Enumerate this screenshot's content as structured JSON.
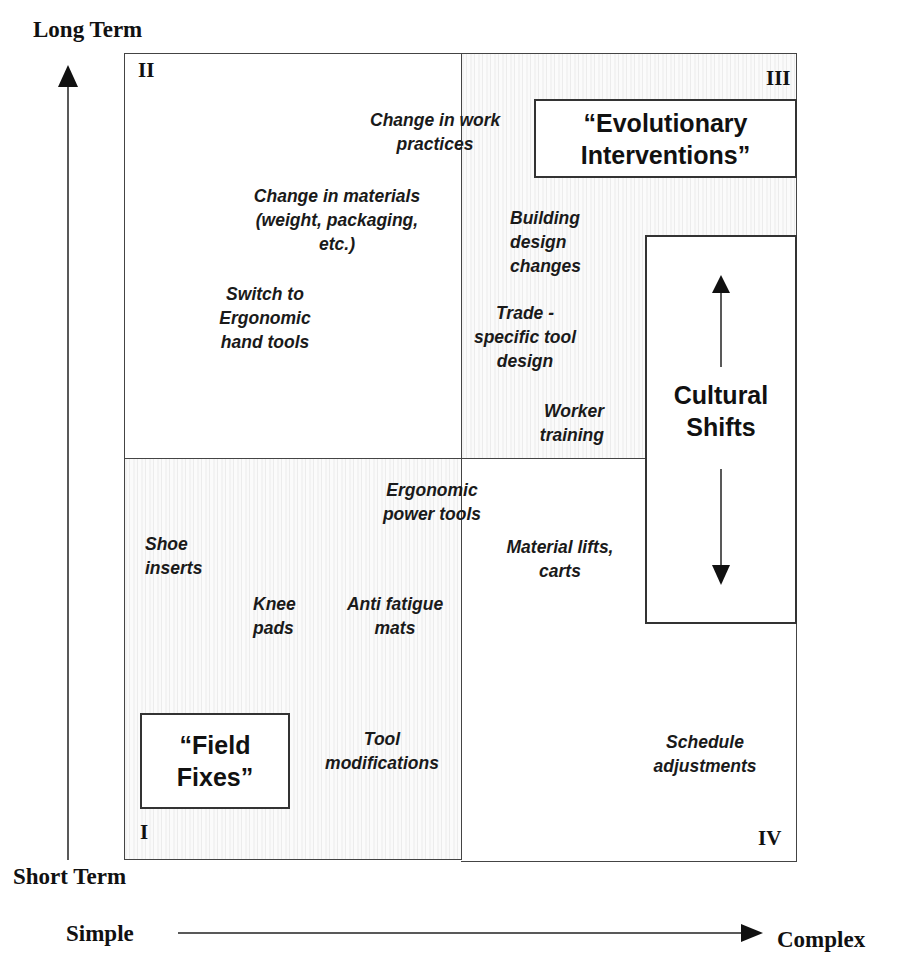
{
  "axes": {
    "y_top_label": "Long Term",
    "y_bottom_label": "Short Term",
    "x_left_label": "Simple",
    "x_right_label": "Complex"
  },
  "quadrants": {
    "q1": {
      "numeral": "I",
      "textured": true
    },
    "q2": {
      "numeral": "II",
      "textured": false
    },
    "q3": {
      "numeral": "III",
      "textured": true
    },
    "q4": {
      "numeral": "IV",
      "textured": false
    }
  },
  "boxes": {
    "field_fixes": "“Field\nFixes”",
    "evolutionary": "“Evolutionary\nInterventions”",
    "cultural_shifts": "Cultural\nShifts"
  },
  "items": {
    "change_work_practices": "Change in work\npractices",
    "change_materials": "Change in materials\n(weight, packaging,\netc.)",
    "switch_ergonomic": "Switch to\nErgonomic\nhand tools",
    "building_design": "Building\ndesign\nchanges",
    "trade_specific": "Trade -\nspecific tool\ndesign",
    "worker_training": "Worker\ntraining",
    "ergonomic_power": "Ergonomic\npower tools",
    "shoe_inserts": "Shoe\ninserts",
    "knee_pads": "Knee\npads",
    "anti_fatigue": "Anti fatigue\nmats",
    "tool_modifications": "Tool\nmodifications",
    "material_lifts": "Material lifts,\ncarts",
    "schedule_adjustments": "Schedule\nadjustments"
  }
}
